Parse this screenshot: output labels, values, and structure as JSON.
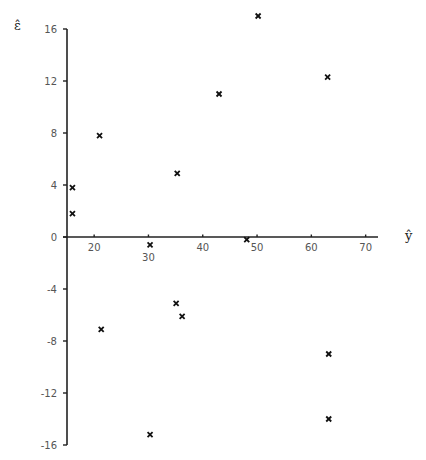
{
  "chart_data": {
    "type": "scatter",
    "title": "",
    "xlabel": "ŷ",
    "ylabel": "ε̂",
    "xlim": [
      15,
      75
    ],
    "ylim": [
      -16,
      16
    ],
    "x_ticks": [
      20,
      30,
      40,
      50,
      60,
      70
    ],
    "y_ticks": [
      -16,
      -12,
      -8,
      -4,
      0,
      4,
      8,
      12,
      16
    ],
    "grid": false,
    "legend": null,
    "marker": "x",
    "points": [
      {
        "x": 16,
        "y": 3.8
      },
      {
        "x": 16,
        "y": 1.8
      },
      {
        "x": 21,
        "y": 7.8
      },
      {
        "x": 21.3,
        "y": -7.1
      },
      {
        "x": 30.3,
        "y": -0.6
      },
      {
        "x": 30.3,
        "y": -15.2
      },
      {
        "x": 35.3,
        "y": 4.9
      },
      {
        "x": 35.1,
        "y": -5.1
      },
      {
        "x": 36.2,
        "y": -6.1
      },
      {
        "x": 43,
        "y": 11.0
      },
      {
        "x": 48.1,
        "y": -0.2
      },
      {
        "x": 50.2,
        "y": 17.0
      },
      {
        "x": 63,
        "y": 12.3
      },
      {
        "x": 63.2,
        "y": -9.0
      },
      {
        "x": 63.2,
        "y": -14.0
      }
    ]
  },
  "colors": {
    "axis": "#222222",
    "marker": "#111111",
    "text": "#555555"
  }
}
